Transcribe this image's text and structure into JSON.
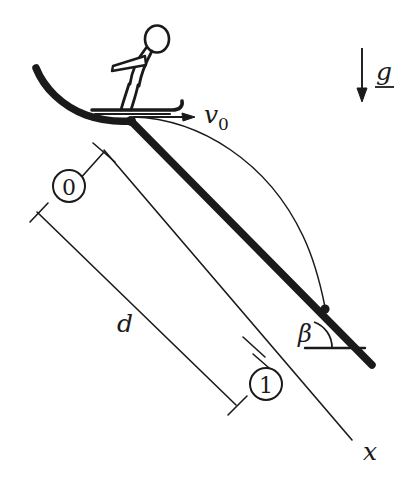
{
  "figure": {
    "kind": "physics-diagram",
    "background_color": "#ffffff",
    "ink_color": "#1a1a1a"
  },
  "labels": {
    "initial_velocity": "v",
    "initial_velocity_subscript": "0",
    "gravity": "g",
    "distance": "d",
    "angle": "β",
    "axis_x": "x",
    "state_start": "0",
    "state_end": "1"
  },
  "elements": {
    "skier": "skier-figure",
    "ski": "ski",
    "ramp": "curved-ramp-lip",
    "slope": "inclined-slope",
    "trajectory": "projectile-trajectory",
    "velocity_arrow": "velocity-arrow",
    "gravity_arrow": "gravity-arrow",
    "dimension_line": "distance-dimension-line",
    "axis_line": "x-axis-line",
    "angle_arc": "beta-angle-arc",
    "horizontal_reference": "horizontal-reference-line",
    "launch_point": "launch-point-marker",
    "landing_point": "landing-point-marker",
    "leader_start": "state-0-leader-line",
    "leader_end": "state-1-leader-line"
  },
  "geometry": {
    "launch_point": {
      "x": 131,
      "y": 121
    },
    "landing_point": {
      "x": 325,
      "y": 309
    },
    "slope_end": {
      "x": 372,
      "y": 365
    },
    "axis_x_end": {
      "x": 352,
      "y": 440
    },
    "gravity_arrow_top": {
      "x": 362,
      "y": 48
    },
    "gravity_arrow_bottom": {
      "x": 362,
      "y": 101
    },
    "slope_angle_degrees": 45
  }
}
